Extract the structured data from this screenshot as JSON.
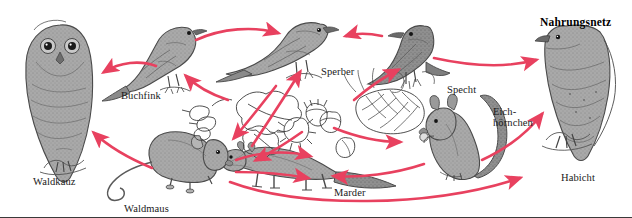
{
  "figure": {
    "title": "Nahrungsnetz",
    "title_position": {
      "x": 540,
      "y": 16
    },
    "width": 632,
    "height": 218,
    "background_color": "#ffffff",
    "arrow_color": "#e8415f",
    "ink_color": "#3a3a3a",
    "fill_gray": "#a6a6a6"
  },
  "organisms": [
    {
      "id": "waldkauz",
      "label": "Waldkauz",
      "kind": "owl",
      "label_position": {
        "x": 33,
        "y": 176
      },
      "anchor": {
        "x": 58,
        "y": 110
      }
    },
    {
      "id": "buchfink",
      "label": "Buchfink",
      "kind": "finch",
      "label_position": {
        "x": 121,
        "y": 90
      },
      "anchor": {
        "x": 172,
        "y": 62
      }
    },
    {
      "id": "sperber",
      "label": "Sperber",
      "kind": "hawk",
      "label_position": {
        "x": 321,
        "y": 66
      },
      "anchor": {
        "x": 300,
        "y": 48
      }
    },
    {
      "id": "specht",
      "label": "Specht",
      "kind": "woodpecker",
      "label_position": {
        "x": 447,
        "y": 84
      },
      "anchor": {
        "x": 432,
        "y": 50
      }
    },
    {
      "id": "habicht",
      "label": "Habicht",
      "kind": "goshawk",
      "label_position": {
        "x": 561,
        "y": 172
      },
      "anchor": {
        "x": 580,
        "y": 80
      }
    },
    {
      "id": "eichhoernchen",
      "label_line1": "Eich-",
      "label_line2": "hörnchen",
      "kind": "squirrel",
      "label_position": {
        "x": 493,
        "y": 106
      },
      "anchor": {
        "x": 470,
        "y": 155
      }
    },
    {
      "id": "marder",
      "label": "Marder",
      "kind": "marten",
      "label_position": {
        "x": 334,
        "y": 187
      },
      "anchor": {
        "x": 300,
        "y": 170
      }
    },
    {
      "id": "waldmaus",
      "label": "Waldmaus",
      "kind": "mouse",
      "label_position": {
        "x": 124,
        "y": 203
      },
      "anchor": {
        "x": 178,
        "y": 175
      }
    },
    {
      "id": "pflanzennahrung",
      "label": "",
      "kind": "plant-food-acorns-leaves-cone",
      "label_position": {
        "x": 300,
        "y": 120
      },
      "anchor": {
        "x": 300,
        "y": 122
      }
    }
  ],
  "food_web_links": [
    {
      "from": "buchfink",
      "to": "waldkauz"
    },
    {
      "from": "buchfink",
      "to": "sperber"
    },
    {
      "from": "specht",
      "to": "sperber"
    },
    {
      "from": "specht",
      "to": "habicht"
    },
    {
      "from": "waldmaus",
      "to": "waldkauz"
    },
    {
      "from": "waldmaus",
      "to": "marder"
    },
    {
      "from": "waldmaus",
      "to": "habicht"
    },
    {
      "from": "pflanzennahrung",
      "to": "buchfink"
    },
    {
      "from": "pflanzennahrung",
      "to": "specht"
    },
    {
      "from": "pflanzennahrung",
      "to": "waldmaus"
    },
    {
      "from": "pflanzennahrung",
      "to": "eichhoernchen"
    },
    {
      "from": "pflanzennahrung",
      "to": "marder"
    },
    {
      "from": "eichhoernchen",
      "to": "marder"
    },
    {
      "from": "eichhoernchen",
      "to": "habicht"
    },
    {
      "from": "marder",
      "to": "sperber"
    }
  ]
}
